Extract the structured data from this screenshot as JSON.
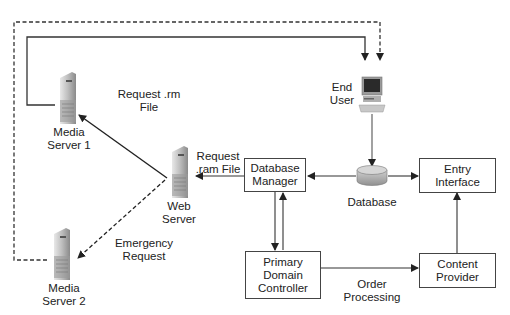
{
  "diagram": {
    "nodes": {
      "media_server_1": {
        "label": "Media\nServer 1",
        "icon": "server-tower-icon"
      },
      "media_server_2": {
        "label": "Media\nServer 2",
        "icon": "server-tower-icon"
      },
      "web_server": {
        "label": "Web\nServer",
        "icon": "server-tower-icon"
      },
      "end_user": {
        "label": "End\nUser",
        "icon": "desktop-computer-icon"
      },
      "database": {
        "label": "Database",
        "icon": "database-cylinder-icon"
      },
      "database_manager": {
        "label": "Database\nManager"
      },
      "entry_interface": {
        "label": "Entry\nInterface"
      },
      "primary_domain_controller": {
        "label": "Primary\nDomain\nController"
      },
      "content_provider": {
        "label": "Content\nProvider"
      }
    },
    "edge_labels": {
      "request_rm_file": "Request .rm\nFile",
      "request_ram_file": "Request\n.ram File",
      "emergency_request": "Emergency\nRequest",
      "order_processing": "Order\nProcessing"
    },
    "edges": [
      {
        "from": "media_server_1",
        "to": "end_user",
        "style": "solid"
      },
      {
        "from": "media_server_2",
        "to": "end_user",
        "style": "dashed"
      },
      {
        "from": "web_server",
        "to": "media_server_1",
        "style": "solid",
        "label": "Request .rm File"
      },
      {
        "from": "web_server",
        "to": "media_server_2",
        "style": "dashed",
        "label": "Emergency Request"
      },
      {
        "from": "database_manager",
        "to": "web_server",
        "style": "solid",
        "label": "Request .ram File"
      },
      {
        "from": "end_user",
        "to": "database",
        "style": "solid"
      },
      {
        "from": "database",
        "to": "database_manager",
        "style": "solid"
      },
      {
        "from": "database",
        "to": "entry_interface",
        "style": "solid"
      },
      {
        "from": "database_manager",
        "to": "primary_domain_controller",
        "style": "solid"
      },
      {
        "from": "primary_domain_controller",
        "to": "database_manager",
        "style": "solid"
      },
      {
        "from": "primary_domain_controller",
        "to": "content_provider",
        "style": "solid",
        "label": "Order Processing"
      },
      {
        "from": "content_provider",
        "to": "entry_interface",
        "style": "solid"
      }
    ],
    "colors": {
      "line": "#333333",
      "box_border": "#444444",
      "text": "#222222"
    }
  }
}
